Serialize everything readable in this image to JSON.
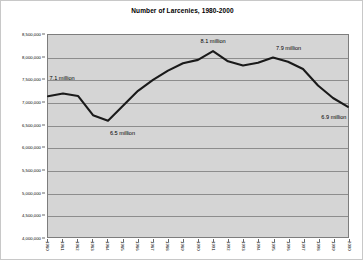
{
  "chart_data": {
    "type": "line",
    "title": "Number of Larcenies, 1980-2000",
    "xlabel": "",
    "ylabel": "",
    "grid": true,
    "legend": "none",
    "plot_background": "#d5d5d5",
    "line_color": "#1a1a1a",
    "gridline_color": "#8d8d8d",
    "ylim": [
      4000000,
      8500000
    ],
    "ytick_step": 500000,
    "x": [
      1980,
      1981,
      1982,
      1983,
      1984,
      1985,
      1986,
      1987,
      1988,
      1989,
      1990,
      1991,
      1992,
      1993,
      1994,
      1995,
      1996,
      1997,
      1998,
      1999,
      2000
    ],
    "categories": [
      "1980",
      "1981",
      "1982",
      "1983",
      "1984",
      "1985",
      "1986",
      "1987",
      "1988",
      "1989",
      "1990",
      "1991",
      "1992",
      "1993",
      "1994",
      "1995",
      "1996",
      "1997",
      "1998",
      "1999",
      "2000"
    ],
    "values": [
      7137000,
      7195000,
      7143000,
      6713000,
      6592000,
      6926000,
      7257000,
      7500000,
      7706000,
      7872000,
      7946000,
      8142000,
      7915000,
      7821000,
      7880000,
      8000000,
      7905000,
      7744000,
      7376000,
      7097000,
      6900000
    ],
    "ytick_labels": [
      "8,500,000",
      "8,000,000",
      "7,500,000",
      "7,000,000",
      "6,500,000",
      "6,000,000",
      "5,500,000",
      "5,000,000",
      "4,500,000",
      "4,000,000"
    ],
    "ytick_values": [
      8500000,
      8000000,
      7500000,
      7000000,
      6500000,
      6000000,
      5500000,
      5000000,
      4500000,
      4000000
    ],
    "annotations": [
      {
        "label": "7.1 million",
        "x_year": 1981,
        "y_value": 7500000
      },
      {
        "label": "6.5 million",
        "x_year": 1985,
        "y_value": 6300000
      },
      {
        "label": "8.1 million",
        "x_year": 1991,
        "y_value": 8330000
      },
      {
        "label": "7.9 million",
        "x_year": 1996,
        "y_value": 8180000
      },
      {
        "label": "6.9 million",
        "x_year": 1999,
        "y_value": 6640000
      }
    ]
  }
}
